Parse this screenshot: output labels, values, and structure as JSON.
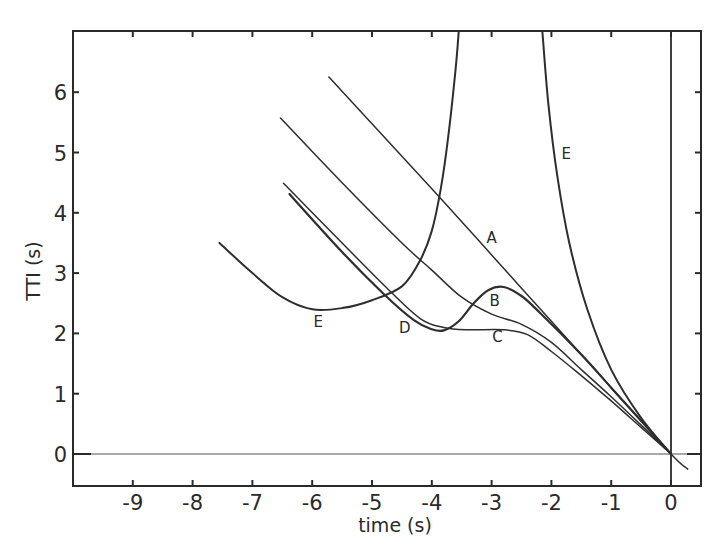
{
  "chart_data": {
    "type": "line",
    "title": "",
    "xlabel": "time (s)",
    "ylabel": "TTI (s)",
    "xlim": [
      -10,
      0.5
    ],
    "ylim": [
      -0.5,
      7
    ],
    "grid": false,
    "legend": "inline labels",
    "x_ticks": [
      -9,
      -8,
      -7,
      -6,
      -5,
      -4,
      -3,
      -2,
      -1,
      0
    ],
    "x_tick_labels": [
      "-9",
      "-8",
      "-7",
      "-6",
      "-5",
      "-4",
      "-3",
      "-2",
      "-1",
      "0"
    ],
    "y_ticks": [
      0,
      1,
      2,
      3,
      4,
      5,
      6
    ],
    "y_tick_labels": [
      "0",
      "1",
      "2",
      "3",
      "4",
      "5",
      "6"
    ],
    "reference_lines": [
      {
        "orientation": "horizontal",
        "value": 0
      },
      {
        "orientation": "vertical",
        "value": 0
      }
    ],
    "series": [
      {
        "name": "A",
        "label_pos": [
          -3.0,
          3.5
        ],
        "width": 1.5,
        "points": [
          [
            -5.72,
            6.25
          ],
          [
            -4.0,
            4.4
          ],
          [
            -3.0,
            3.3
          ],
          [
            -2.0,
            2.2
          ],
          [
            -1.0,
            1.1
          ],
          [
            0.0,
            0.0
          ],
          [
            0.28,
            -0.25
          ]
        ]
      },
      {
        "name": "B",
        "label_pos": [
          -2.95,
          2.45
        ],
        "width": 1.5,
        "points": [
          [
            -6.53,
            5.57
          ],
          [
            -5.5,
            4.5
          ],
          [
            -4.5,
            3.5
          ],
          [
            -4.0,
            3.05
          ],
          [
            -3.5,
            2.6
          ],
          [
            -3.0,
            2.32
          ],
          [
            -2.5,
            2.15
          ],
          [
            -2.0,
            1.85
          ],
          [
            -1.5,
            1.4
          ],
          [
            -1.0,
            0.95
          ],
          [
            -0.5,
            0.48
          ],
          [
            0.0,
            0.0
          ]
        ]
      },
      {
        "name": "C",
        "label_pos": [
          -2.9,
          1.85
        ],
        "width": 1.5,
        "points": [
          [
            -6.48,
            4.49
          ],
          [
            -5.5,
            3.5
          ],
          [
            -4.8,
            2.8
          ],
          [
            -4.2,
            2.25
          ],
          [
            -3.8,
            2.1
          ],
          [
            -3.4,
            2.06
          ],
          [
            -2.8,
            2.06
          ],
          [
            -2.4,
            1.98
          ],
          [
            -2.0,
            1.7
          ],
          [
            -1.5,
            1.3
          ],
          [
            -1.0,
            0.88
          ],
          [
            -0.5,
            0.44
          ],
          [
            0.0,
            0.0
          ]
        ]
      },
      {
        "name": "D",
        "label_pos": [
          -4.45,
          2.0
        ],
        "width": 2.2,
        "points": [
          [
            -6.38,
            4.31
          ],
          [
            -5.5,
            3.35
          ],
          [
            -4.8,
            2.65
          ],
          [
            -4.3,
            2.22
          ],
          [
            -4.0,
            2.07
          ],
          [
            -3.8,
            2.05
          ],
          [
            -3.55,
            2.2
          ],
          [
            -3.3,
            2.5
          ],
          [
            -3.05,
            2.72
          ],
          [
            -2.8,
            2.77
          ],
          [
            -2.5,
            2.62
          ],
          [
            -2.2,
            2.35
          ],
          [
            -1.5,
            1.65
          ],
          [
            -1.0,
            1.1
          ],
          [
            -0.5,
            0.55
          ],
          [
            0.0,
            0.0
          ]
        ]
      },
      {
        "name": "E",
        "label_pos": [
          -5.9,
          2.1
        ],
        "width": 2.0,
        "points": [
          [
            -7.55,
            3.5
          ],
          [
            -7.0,
            3.0
          ],
          [
            -6.5,
            2.6
          ],
          [
            -6.0,
            2.4
          ],
          [
            -5.5,
            2.42
          ],
          [
            -5.0,
            2.55
          ],
          [
            -4.5,
            2.78
          ],
          [
            -4.2,
            3.2
          ],
          [
            -4.0,
            3.7
          ],
          [
            -3.85,
            4.4
          ],
          [
            -3.72,
            5.3
          ],
          [
            -3.6,
            6.4
          ],
          [
            -3.55,
            7.0
          ]
        ]
      },
      {
        "name": "E",
        "label_pos": [
          -1.75,
          4.9
        ],
        "width": 2.0,
        "points": [
          [
            -2.15,
            7.0
          ],
          [
            -2.05,
            5.8
          ],
          [
            -1.9,
            4.6
          ],
          [
            -1.7,
            3.5
          ],
          [
            -1.4,
            2.4
          ],
          [
            -1.0,
            1.4
          ],
          [
            -0.5,
            0.6
          ],
          [
            0.0,
            0.0
          ]
        ]
      }
    ]
  }
}
